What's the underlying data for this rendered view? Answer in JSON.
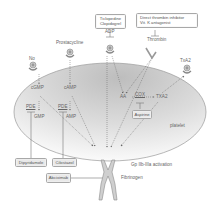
{
  "diagram": {
    "cell_label": "platelet",
    "receptors": [
      {
        "id": "no",
        "label": "No"
      },
      {
        "id": "prostacycline",
        "label": "Prostacycline"
      },
      {
        "id": "adp",
        "label": "ADP"
      },
      {
        "id": "thrombin",
        "label": "Thrombin"
      },
      {
        "id": "txa2_receptor",
        "label": "TxA2"
      }
    ],
    "messengers": {
      "cgmp": "cGMP",
      "camp": "cAMP",
      "gmp": "GMP",
      "amp": "AMP",
      "pde1": "PDE",
      "pde2": "PDE",
      "aa": "AA",
      "cox": "COX",
      "txa2": "TXA2"
    },
    "drugs": {
      "ticlopidine": [
        "Ticlopedine",
        "Clopidogrel"
      ],
      "thrombin_inhibitor": [
        "Direct thrombin inhibitor",
        "Vit. K antagonist"
      ],
      "aspirine": "Aspirine",
      "dipyridamole": "Dipyridamole",
      "cilostazol": "Cilostazol",
      "abciximab": "Abciximab"
    },
    "bottom": {
      "gp_activation": "Gp IIb-IIIa activation",
      "fibrinogen": "Fibrinogen"
    },
    "colors": {
      "cell_fill_top": "#b9b9b9",
      "cell_fill_bottom": "#ffffff",
      "line": "#777777",
      "box_fill": "#e9e9e9",
      "box_border": "#a8a8a8"
    }
  }
}
